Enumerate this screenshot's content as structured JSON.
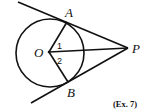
{
  "diagram": {
    "type": "geometry",
    "stroke_color": "#111111",
    "background": "#ffffff",
    "circle": {
      "center_label": "O",
      "cx": 50,
      "cy": 53,
      "r": 34
    },
    "points": {
      "O": {
        "label": "O",
        "x": 49,
        "y": 52
      },
      "A": {
        "label": "A",
        "x": 67,
        "y": 22
      },
      "B": {
        "label": "B",
        "x": 68,
        "y": 82
      },
      "P": {
        "label": "P",
        "x": 128,
        "y": 48
      }
    },
    "angle_labels": {
      "angle1": {
        "label": "1"
      },
      "angle2": {
        "label": "2"
      }
    },
    "segments": [
      "OA",
      "OB",
      "OP",
      "PA (tangent, extended past A)",
      "PB (tangent, extended past B)"
    ],
    "caption": "(Ex. 7)"
  }
}
